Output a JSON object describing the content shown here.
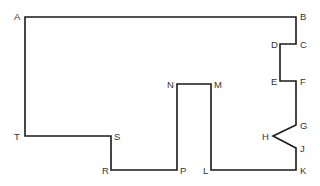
{
  "diagram": {
    "type": "rectilinear polygon outline",
    "stroke_color": "#1a1a1a",
    "label_color": "#333333",
    "background": "#ffffff",
    "path_order": [
      "A",
      "B",
      "C",
      "D",
      "E",
      "F",
      "G",
      "H",
      "J",
      "K",
      "L",
      "M",
      "N",
      "P",
      "R",
      "S",
      "T"
    ],
    "vertices": [
      {
        "id": "A",
        "x": 25,
        "y": 17,
        "label": "A",
        "lx": 14,
        "ly": 20
      },
      {
        "id": "B",
        "x": 296,
        "y": 17,
        "label": "B",
        "lx": 300,
        "ly": 20
      },
      {
        "id": "C",
        "x": 296,
        "y": 44,
        "label": "C",
        "lx": 300,
        "ly": 48
      },
      {
        "id": "D",
        "x": 280,
        "y": 44,
        "label": "D",
        "lx": 271,
        "ly": 48
      },
      {
        "id": "E",
        "x": 280,
        "y": 81,
        "label": "E",
        "lx": 271,
        "ly": 85
      },
      {
        "id": "F",
        "x": 296,
        "y": 81,
        "label": "F",
        "lx": 300,
        "ly": 85
      },
      {
        "id": "G",
        "x": 296,
        "y": 125,
        "label": "G",
        "lx": 300,
        "ly": 129
      },
      {
        "id": "H",
        "x": 273,
        "y": 136,
        "label": "H",
        "lx": 262,
        "ly": 140
      },
      {
        "id": "J",
        "x": 296,
        "y": 148,
        "label": "J",
        "lx": 300,
        "ly": 152
      },
      {
        "id": "K",
        "x": 296,
        "y": 170,
        "label": "K",
        "lx": 300,
        "ly": 174
      },
      {
        "id": "L",
        "x": 211,
        "y": 170,
        "label": "L",
        "lx": 203,
        "ly": 174
      },
      {
        "id": "M",
        "x": 211,
        "y": 84,
        "label": "M",
        "lx": 214,
        "ly": 88
      },
      {
        "id": "N",
        "x": 177,
        "y": 84,
        "label": "N",
        "lx": 167,
        "ly": 88
      },
      {
        "id": "P",
        "x": 177,
        "y": 170,
        "label": "P",
        "lx": 180,
        "ly": 174
      },
      {
        "id": "R",
        "x": 111,
        "y": 170,
        "label": "R",
        "lx": 102,
        "ly": 174
      },
      {
        "id": "S",
        "x": 111,
        "y": 136,
        "label": "S",
        "lx": 114,
        "ly": 140
      },
      {
        "id": "T",
        "x": 25,
        "y": 136,
        "label": "T",
        "lx": 14,
        "ly": 140
      }
    ]
  }
}
